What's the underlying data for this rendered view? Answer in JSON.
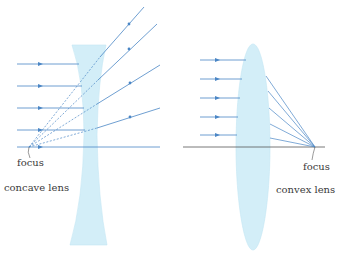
{
  "diagram": {
    "type": "optics-lens-comparison",
    "colors": {
      "lens_fill": "#d3eef8",
      "lens_edge": "#b8e2f2",
      "ray": "#4a86c5",
      "axis": "#4a86c5",
      "axis_dark": "#555555",
      "text": "#3a3a3a"
    },
    "concave": {
      "caption": "concave lens",
      "focus_label": "focus",
      "incoming_ray_count": 5,
      "behavior": "diverging — refracted rays spread out and appear to come from the focus (dashed back-extensions)"
    },
    "convex": {
      "caption": "convex lens",
      "focus_label": "focus",
      "incoming_ray_count": 5,
      "behavior": "converging — refracted rays meet at the focus on the far side"
    }
  }
}
